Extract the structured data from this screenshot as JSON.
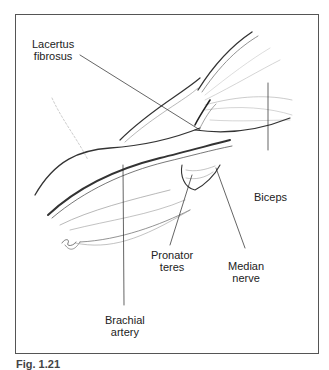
{
  "figure": {
    "labels": {
      "lacertus": [
        "Lacertus",
        "fibrosus"
      ],
      "biceps": [
        "Biceps"
      ],
      "pronator": [
        "Pronator",
        "teres"
      ],
      "median": [
        "Median",
        "nerve"
      ],
      "brachial": [
        "Brachial",
        "artery"
      ]
    },
    "caption": "Fig. 1.21",
    "signature": "signature"
  }
}
